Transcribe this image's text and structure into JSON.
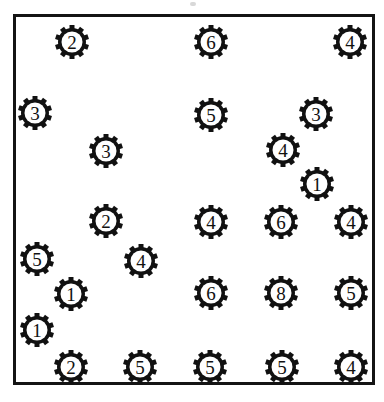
{
  "figure": {
    "title": "",
    "background_color": "#ffffff",
    "frame_color": "#141414",
    "marker_color": "#111111",
    "marker_label_color": "#111111",
    "marker_icon": "gear-icon"
  },
  "chart_data": {
    "type": "scatter",
    "title": "",
    "xlabel": "",
    "ylabel": "",
    "xlim": [
      0,
      384
    ],
    "ylim": [
      0,
      402
    ],
    "grid": false,
    "legend": null,
    "marker_shape": "gear",
    "point_label_field": "value",
    "points": [
      {
        "x": 72,
        "y": 42,
        "value": "2"
      },
      {
        "x": 211,
        "y": 42,
        "value": "6"
      },
      {
        "x": 350,
        "y": 42,
        "value": "4"
      },
      {
        "x": 35,
        "y": 113,
        "value": "3"
      },
      {
        "x": 211,
        "y": 115,
        "value": "5"
      },
      {
        "x": 316,
        "y": 114,
        "value": "3"
      },
      {
        "x": 106,
        "y": 151,
        "value": "3"
      },
      {
        "x": 283,
        "y": 150,
        "value": "4"
      },
      {
        "x": 317,
        "y": 184,
        "value": "1"
      },
      {
        "x": 106,
        "y": 221,
        "value": "2"
      },
      {
        "x": 211,
        "y": 222,
        "value": "4"
      },
      {
        "x": 281,
        "y": 222,
        "value": "6"
      },
      {
        "x": 351,
        "y": 222,
        "value": "4"
      },
      {
        "x": 37,
        "y": 259,
        "value": "5"
      },
      {
        "x": 141,
        "y": 261,
        "value": "4"
      },
      {
        "x": 71,
        "y": 294,
        "value": "1"
      },
      {
        "x": 211,
        "y": 293,
        "value": "6"
      },
      {
        "x": 281,
        "y": 293,
        "value": "8"
      },
      {
        "x": 351,
        "y": 293,
        "value": "5"
      },
      {
        "x": 37,
        "y": 330,
        "value": "1"
      },
      {
        "x": 71,
        "y": 367,
        "value": "2"
      },
      {
        "x": 140,
        "y": 367,
        "value": "5"
      },
      {
        "x": 210,
        "y": 367,
        "value": "5"
      },
      {
        "x": 282,
        "y": 367,
        "value": "5"
      },
      {
        "x": 351,
        "y": 367,
        "value": "4"
      }
    ]
  }
}
